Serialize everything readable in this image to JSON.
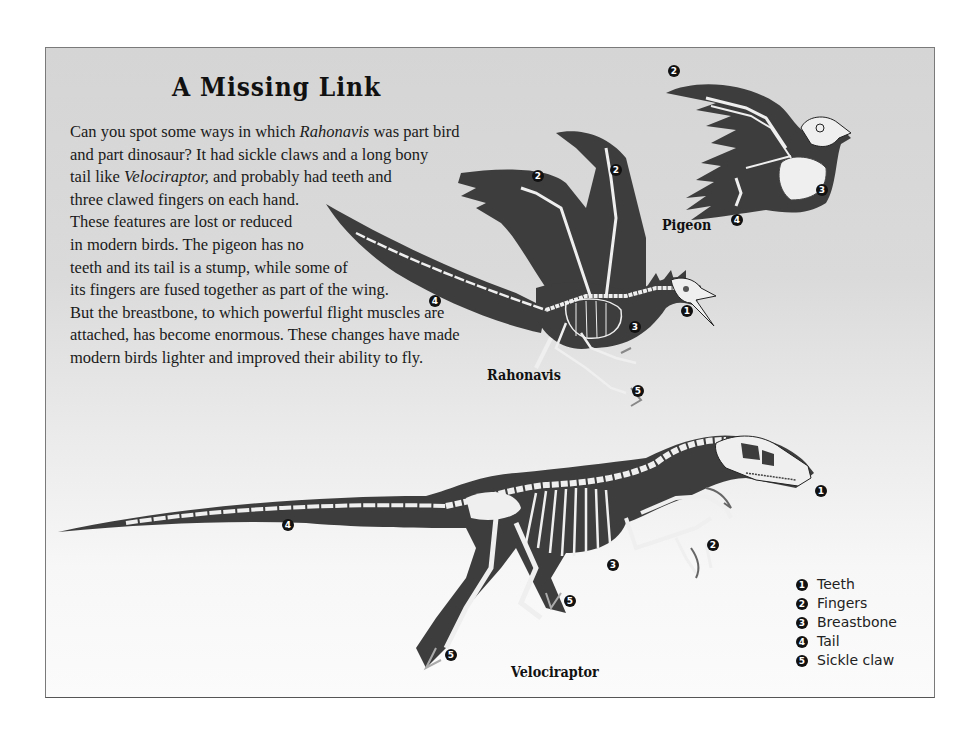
{
  "page": {
    "title": "A Missing Link",
    "paragraph_lines": [
      {
        "parts": [
          {
            "t": "Can you spot some ways in which "
          },
          {
            "t": "Rahonavis",
            "i": true
          },
          {
            "t": " was part bird"
          }
        ]
      },
      {
        "parts": [
          {
            "t": "and part dinosaur? It had sickle claws and a long bony"
          }
        ]
      },
      {
        "parts": [
          {
            "t": "tail like "
          },
          {
            "t": "Velociraptor,",
            "i": true
          },
          {
            "t": " and probably had teeth and"
          }
        ]
      },
      {
        "parts": [
          {
            "t": "three clawed fingers on each hand."
          }
        ]
      },
      {
        "parts": [
          {
            "t": "These features are lost or reduced"
          }
        ]
      },
      {
        "parts": [
          {
            "t": "in modern birds. The pigeon has no"
          }
        ]
      },
      {
        "parts": [
          {
            "t": "teeth and its tail is a stump, while some of"
          }
        ]
      },
      {
        "parts": [
          {
            "t": "its fingers are fused together as part of the wing."
          }
        ]
      },
      {
        "parts": [
          {
            "t": "But the breastbone, to which powerful flight muscles are"
          }
        ]
      },
      {
        "parts": [
          {
            "t": "attached, has become enormous. These changes have made"
          }
        ]
      },
      {
        "parts": [
          {
            "t": "modern birds lighter and improved their ability to fly."
          }
        ]
      }
    ]
  },
  "animals": {
    "pigeon": "Pigeon",
    "rahonavis": "Rahonavis",
    "velociraptor": "Velociraptor"
  },
  "legend": [
    {
      "num": "1",
      "label": "Teeth"
    },
    {
      "num": "2",
      "label": "Fingers"
    },
    {
      "num": "3",
      "label": "Breastbone"
    },
    {
      "num": "4",
      "label": "Tail"
    },
    {
      "num": "5",
      "label": "Sickle claw"
    }
  ],
  "callouts": {
    "pigeon": [
      {
        "num": "2",
        "x": 622,
        "y": 17
      },
      {
        "num": "3",
        "x": 770,
        "y": 136
      },
      {
        "num": "4",
        "x": 685,
        "y": 166
      }
    ],
    "rahonavis": [
      {
        "num": "2",
        "x": 486,
        "y": 122
      },
      {
        "num": "2",
        "x": 564,
        "y": 116
      },
      {
        "num": "4",
        "x": 383,
        "y": 247
      },
      {
        "num": "1",
        "x": 635,
        "y": 257
      },
      {
        "num": "3",
        "x": 583,
        "y": 273
      },
      {
        "num": "5",
        "x": 586,
        "y": 337
      }
    ],
    "velociraptor": [
      {
        "num": "1",
        "x": 769,
        "y": 437
      },
      {
        "num": "4",
        "x": 236,
        "y": 471
      },
      {
        "num": "2",
        "x": 661,
        "y": 491
      },
      {
        "num": "3",
        "x": 561,
        "y": 511
      },
      {
        "num": "5",
        "x": 518,
        "y": 547
      },
      {
        "num": "5",
        "x": 399,
        "y": 601
      }
    ]
  },
  "colors": {
    "silhouette": "#3d3d3d",
    "bone": "#efefef",
    "panel_top": "#d5d5d5",
    "panel_bottom": "#fbfbfb"
  }
}
